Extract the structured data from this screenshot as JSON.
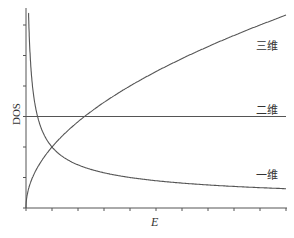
{
  "chart_data": {
    "type": "line",
    "title": "",
    "xlabel": "E",
    "ylabel": "DOS",
    "grid": false,
    "legend": "inline labels at right end of curves",
    "xlim": [
      0,
      10
    ],
    "ylim": [
      0,
      3.25
    ],
    "x_ticks": [
      0,
      1,
      2,
      3,
      4,
      5,
      6,
      7,
      8,
      9,
      10
    ],
    "y_ticks": [
      0,
      0.5,
      1.0,
      1.5,
      2.0,
      2.5,
      3.0
    ],
    "tick_labels_shown": false,
    "series": [
      {
        "name": "三维",
        "formula": "sqrt(E)",
        "x": [
          0,
          0.25,
          0.5,
          1,
          2,
          3,
          4,
          5,
          6,
          7,
          8,
          9,
          10
        ],
        "values": [
          0,
          0.5,
          0.71,
          1,
          1.41,
          1.73,
          2,
          2.24,
          2.45,
          2.65,
          2.83,
          3,
          3.16
        ]
      },
      {
        "name": "二维",
        "formula": "const",
        "x": [
          0,
          10
        ],
        "values": [
          1.5,
          1.5
        ]
      },
      {
        "name": "一维",
        "formula": "1/sqrt(E)",
        "x": [
          0.1,
          0.15,
          0.25,
          0.5,
          1,
          2,
          3,
          4,
          5,
          6,
          7,
          8,
          9,
          10
        ],
        "values": [
          3.16,
          2.58,
          2,
          1.41,
          1,
          0.71,
          0.58,
          0.5,
          0.45,
          0.41,
          0.38,
          0.35,
          0.33,
          0.32
        ]
      }
    ],
    "annotations": [
      "三维",
      "二维",
      "一维"
    ]
  },
  "labels": {
    "ylabel": "DOS",
    "xlabel": "E",
    "three_d": "三维",
    "two_d": "二维",
    "one_d": "一维"
  }
}
